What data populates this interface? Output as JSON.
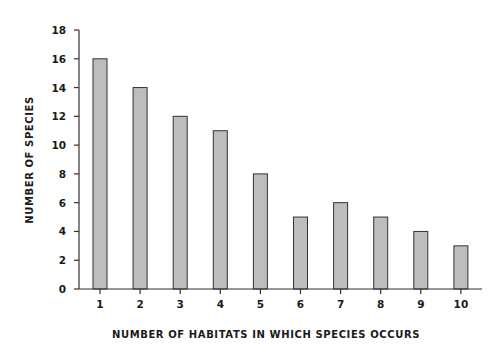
{
  "chart_data": {
    "type": "bar",
    "title": "",
    "xlabel": "NUMBER OF HABITATS IN WHICH SPECIES OCCURS",
    "ylabel": "NUMBER OF SPECIES",
    "categories": [
      "1",
      "2",
      "3",
      "4",
      "5",
      "6",
      "7",
      "8",
      "9",
      "10"
    ],
    "values": [
      16,
      14,
      12,
      11,
      8,
      5,
      6,
      5,
      4,
      3
    ],
    "ylim": [
      0,
      18
    ],
    "yticks": [
      0,
      2,
      4,
      6,
      8,
      10,
      12,
      14,
      16,
      18
    ],
    "grid": false,
    "legend": null,
    "colors": {
      "bar_fill": "#bdbdbd",
      "bar_stroke": "#333333",
      "axis": "#333333"
    }
  }
}
